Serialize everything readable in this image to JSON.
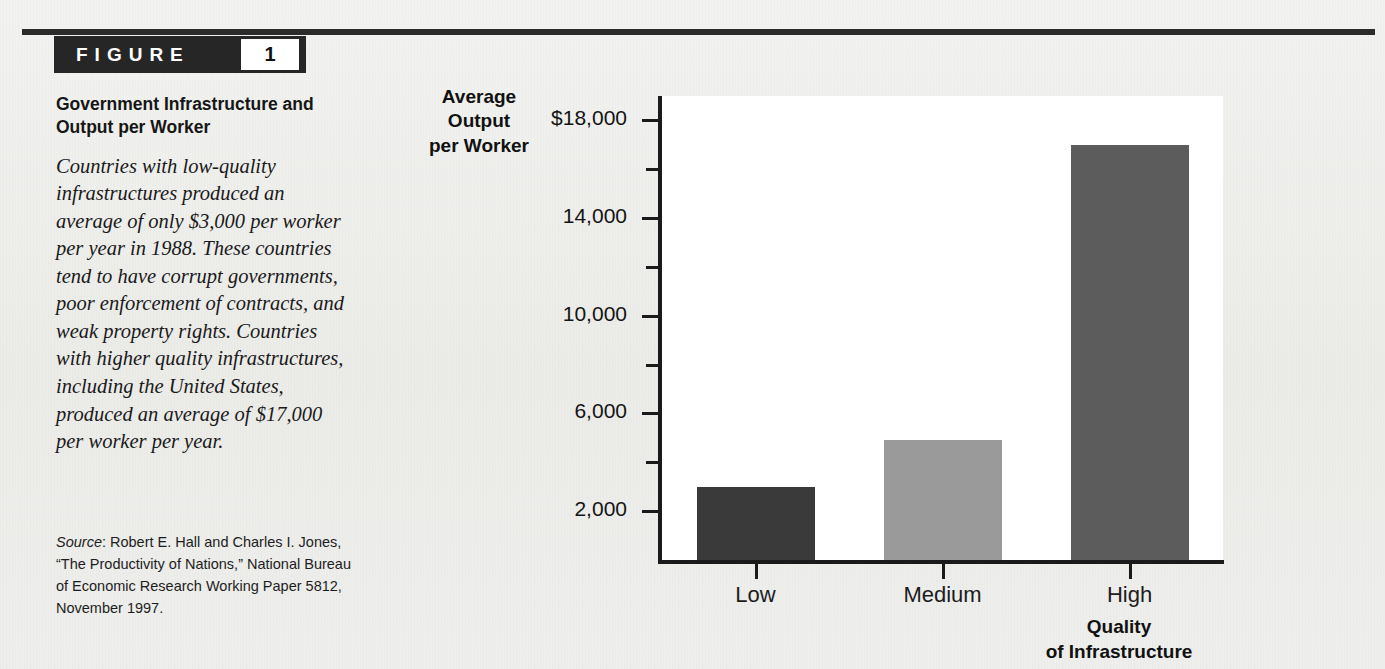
{
  "figure": {
    "label": "FIGURE",
    "number": "1",
    "title": "Government Infrastructure and Output per Worker",
    "body": "Countries with low-quality infrastructures produced an average of only $3,000 per worker per year in 1988. These countries tend to have corrupt governments, poor enforcement of contracts, and weak property rights. Countries with higher quality infrastructures, including the United States, produced an average of $17,000 per worker per year.",
    "source_label": "Source",
    "source_text": ": Robert E. Hall and Charles I. Jones, “The Productivity of Nations,” National Bureau of Economic Research Working Paper 5812, November 1997."
  },
  "chart_data": {
    "type": "bar",
    "title": "Government Infrastructure and Output per Worker",
    "categories": [
      "Low",
      "Medium",
      "High"
    ],
    "values": [
      3000,
      4900,
      17000
    ],
    "xlabel": "Quality of Infrastructure",
    "ylabel": "Average Output per Worker",
    "ylim": [
      0,
      19000
    ],
    "ytick_major": [
      2000,
      6000,
      10000,
      14000,
      18000
    ],
    "ytick_major_labels": [
      "2,000",
      "6,000",
      "10,000",
      "14,000",
      "$18,000"
    ],
    "ytick_minor": [
      4000,
      8000,
      12000,
      16000
    ],
    "grid": false,
    "legend": "none",
    "bar_colors": [
      "#3a3a3a",
      "#9a9a9a",
      "#5c5c5c"
    ]
  },
  "axis": {
    "y_title_lines": [
      "Average",
      "Output",
      "per Worker"
    ],
    "x_title_lines": [
      "Quality",
      "of Infrastructure"
    ]
  },
  "colors": {
    "rule": "#2b2b2b",
    "tab_background": "#262626",
    "tab_text": "#ffffff",
    "plot_background": "#ffffff",
    "page_background": "#efefed"
  }
}
